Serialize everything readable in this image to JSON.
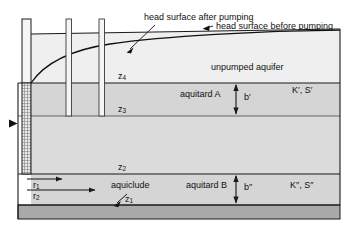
{
  "figure": {
    "type": "hydrogeologic-cross-section"
  },
  "annotations": {
    "head_after": "head surface after pumping",
    "head_before": "head surface before pumping"
  },
  "layers": [
    {
      "id": "unpumped-aquifer",
      "label": "unpumped aquifer",
      "fill": "#eeeeee"
    },
    {
      "id": "aquitard-a",
      "label": "aquitard A",
      "fill": "#d6d6d6",
      "thickness": "b′",
      "properties": "K′, S′"
    },
    {
      "id": "pumped-aquifer",
      "label": "",
      "fill": "#dcdcdc"
    },
    {
      "id": "aquitard-b",
      "label": "aquitard B",
      "fill": "#d6d6d6",
      "thickness": "b″",
      "properties": "K″, S″"
    },
    {
      "id": "aquiclude",
      "label": "aquiclude",
      "fill": "#a8a8a8"
    }
  ],
  "depth_markers": [
    {
      "id": "z4",
      "base": "z",
      "sub": "4"
    },
    {
      "id": "z3",
      "base": "z",
      "sub": "3"
    },
    {
      "id": "z2",
      "base": "z",
      "sub": "2"
    },
    {
      "id": "z1",
      "base": "z",
      "sub": "1"
    }
  ],
  "radial_distances": [
    {
      "id": "r1",
      "base": "r",
      "sub": "1"
    },
    {
      "id": "r2",
      "base": "r",
      "sub": "2"
    }
  ],
  "thickness_markers": [
    {
      "id": "b-prime",
      "text": "b′"
    },
    {
      "id": "b-double-prime",
      "text": "b″"
    }
  ],
  "property_labels": [
    {
      "id": "kp-sp",
      "text": "K′, S′"
    },
    {
      "id": "kpp-spp",
      "text": "K″, S″"
    }
  ],
  "wells": [
    {
      "id": "pumping-well",
      "screened": true
    },
    {
      "id": "observation-well-1",
      "screened": false
    },
    {
      "id": "observation-well-2",
      "screened": false
    }
  ],
  "colors": {
    "line": "#1a1a1a",
    "aquiclude_fill": "#a8a8a8",
    "aquitard_fill": "#d6d6d6",
    "aquifer_fill": "#dcdcdc",
    "top_aquifer_fill": "#eeeeee",
    "well_fill": "#f2f2f2",
    "background": "#ffffff"
  }
}
